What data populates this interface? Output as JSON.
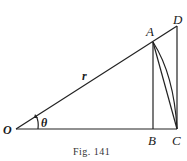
{
  "figure": {
    "caption": "Fig. 141",
    "points": {
      "O": {
        "label": "O",
        "x": 16,
        "y": 129
      },
      "A": {
        "label": "A",
        "x": 153,
        "y": 42
      },
      "B": {
        "label": "B",
        "x": 153,
        "y": 129
      },
      "C": {
        "label": "C",
        "x": 177,
        "y": 129
      },
      "D": {
        "label": "D",
        "x": 177,
        "y": 26
      }
    },
    "radius_label": "r",
    "angle_label": "θ",
    "colors": {
      "ink": "#222222",
      "background": "#ffffff"
    }
  }
}
